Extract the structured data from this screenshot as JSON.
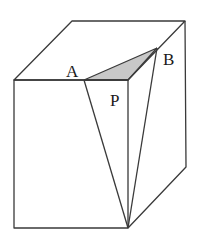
{
  "diagram": {
    "type": "3d-geometry-cuboid",
    "labels": {
      "A": "A",
      "B": "B",
      "P": "P"
    },
    "colors": {
      "edge": "#3a3a3a",
      "shaded_triangle": "#c8c8c8",
      "background": "#ffffff"
    },
    "vertices": {
      "front_top_left": [
        14,
        80
      ],
      "front_top_right": [
        128,
        80
      ],
      "front_bottom_left": [
        14,
        228
      ],
      "front_bottom_right": [
        128,
        228
      ],
      "back_top_left": [
        72,
        21
      ],
      "back_top_right": [
        185,
        21
      ],
      "back_bottom_right": [
        186,
        167
      ],
      "A": [
        84,
        80
      ],
      "B": [
        157,
        48
      ]
    },
    "shaded_region": "triangle A-B-front_top_right"
  }
}
